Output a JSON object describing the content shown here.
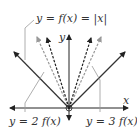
{
  "diagram": {
    "type": "function-graph-transformations",
    "axes": {
      "x_label": "x",
      "y_label": "y"
    },
    "curves": [
      {
        "name": "base",
        "label": "y = f(x) = |x|",
        "style": "solid",
        "color": "#333333"
      },
      {
        "name": "vertical-stretch-2",
        "label": "y = 2 f(x)",
        "style": "dashed",
        "color": "#999999"
      },
      {
        "name": "vertical-stretch-3",
        "label": "y = 3 f(x)",
        "style": "dashed",
        "color": "#333333"
      }
    ],
    "colors": {
      "axis": "#222222",
      "leader": "#999999",
      "background": "#ffffff"
    }
  }
}
